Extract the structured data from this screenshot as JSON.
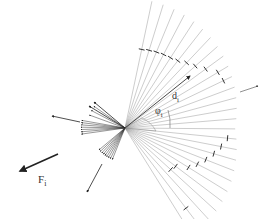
{
  "diagram": {
    "origin": [
      125,
      128
    ],
    "labels": {
      "force": "F",
      "force_sub": "i",
      "distance": "d",
      "distance_sub": "i",
      "angle": "φ",
      "angle_sub": "i"
    },
    "colors": {
      "ray": "#9a9a9a",
      "tick": "#333333",
      "arrow": "#222222"
    },
    "ray_fan": {
      "start_angle_deg": -78,
      "end_angle_deg": 58,
      "count": 27,
      "length_near": 110,
      "length_far": 130
    }
  }
}
